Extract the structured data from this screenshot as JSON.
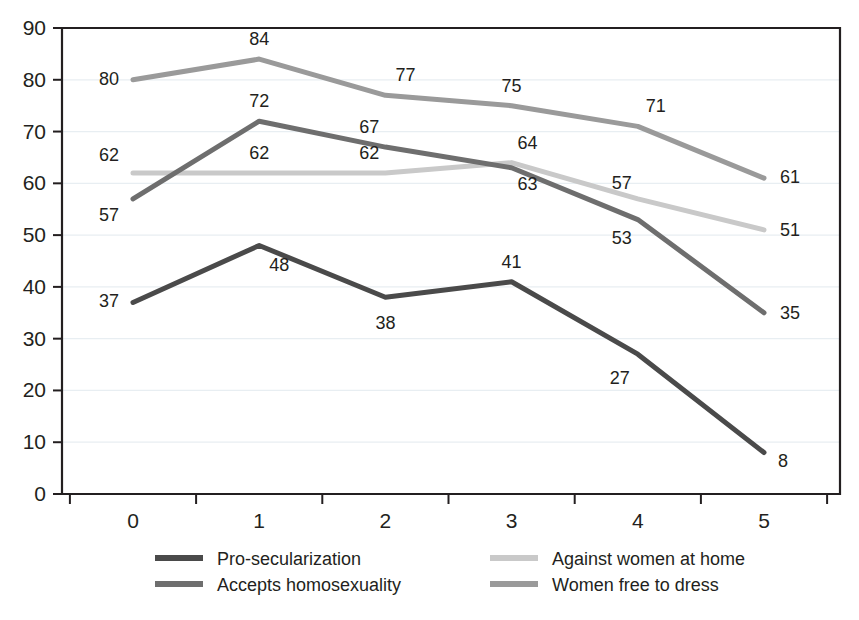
{
  "chart_data": {
    "type": "line",
    "title": "",
    "subtitle": "",
    "xlabel": "",
    "ylabel": "",
    "categories": [
      "0",
      "1",
      "2",
      "3",
      "4",
      "5"
    ],
    "x": [
      0,
      1,
      2,
      3,
      4,
      5
    ],
    "xlim": [
      0,
      5
    ],
    "ylim": [
      0,
      90
    ],
    "y_ticks": [
      0,
      10,
      20,
      30,
      40,
      50,
      60,
      70,
      80,
      90
    ],
    "x_ticks": [
      "0",
      "1",
      "2",
      "3",
      "4",
      "5"
    ],
    "grid": true,
    "grid_axis": "y",
    "legend_position": "bottom",
    "legend_columns": 2,
    "data_labels": true,
    "markers": false,
    "series": [
      {
        "name": "Pro-secularization",
        "color": "#4a4a4a",
        "values": [
          37,
          48,
          38,
          41,
          27,
          8
        ],
        "labels": [
          "37",
          "48",
          "38",
          "41",
          "27",
          "8"
        ]
      },
      {
        "name": "Accepts homosexuality",
        "color": "#6e6e6e",
        "values": [
          57,
          72,
          67,
          63,
          53,
          35
        ],
        "labels": [
          "57",
          "72",
          "67",
          "63",
          "53",
          "35"
        ]
      },
      {
        "name": "Against women at home",
        "color": "#c9c9c9",
        "values": [
          62,
          62,
          62,
          64,
          57,
          51
        ],
        "labels": [
          "62",
          "62",
          "62",
          "64",
          "57",
          "51"
        ]
      },
      {
        "name": "Women free to dress",
        "color": "#9a9a9a",
        "values": [
          80,
          84,
          77,
          75,
          71,
          61
        ],
        "labels": [
          "80",
          "84",
          "77",
          "75",
          "71",
          "61"
        ]
      }
    ]
  },
  "axes": {
    "y_tick_labels": [
      "90",
      "80",
      "70",
      "60",
      "50",
      "40",
      "30",
      "20",
      "10",
      "0"
    ],
    "x_tick_labels": [
      "0",
      "1",
      "2",
      "3",
      "4",
      "5"
    ]
  },
  "legend": {
    "entries": [
      {
        "label": "Pro-secularization",
        "color": "#4a4a4a"
      },
      {
        "label": "Against women at home",
        "color": "#c9c9c9"
      },
      {
        "label": "Accepts homosexuality",
        "color": "#6e6e6e"
      },
      {
        "label": "Women free to dress",
        "color": "#9a9a9a"
      }
    ]
  },
  "colors": {
    "axis": "#231f20",
    "grid": "#e8eef2",
    "background": "#ffffff",
    "text": "#231f20"
  }
}
